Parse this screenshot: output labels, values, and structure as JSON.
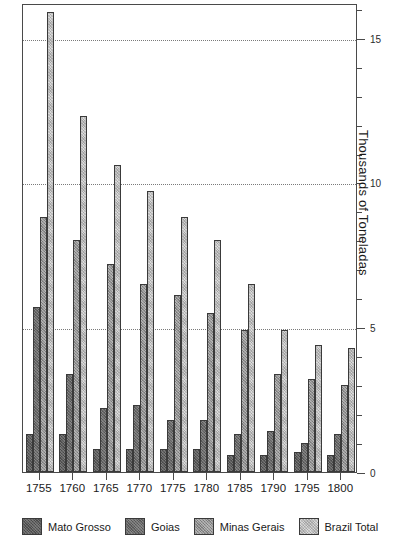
{
  "chart_data": {
    "type": "bar",
    "title": "",
    "subtitle": "",
    "xlabel": "",
    "ylabel": "Thousands of Toneladas",
    "categories": [
      "1755",
      "1760",
      "1765",
      "1770",
      "1775",
      "1780",
      "1785",
      "1790",
      "1795",
      "1800"
    ],
    "series": [
      {
        "name": "Mato Grosso",
        "color": "#595959",
        "values": [
          1.3,
          1.3,
          0.8,
          0.8,
          0.8,
          0.8,
          0.6,
          0.6,
          0.7,
          0.6
        ]
      },
      {
        "name": "Goias",
        "color": "#666666",
        "values": [
          5.7,
          3.4,
          2.2,
          2.3,
          1.8,
          1.8,
          1.3,
          1.4,
          1.0,
          1.3
        ]
      },
      {
        "name": "Minas Gerais",
        "color": "#8f8f8f",
        "values": [
          8.8,
          8.0,
          7.2,
          6.5,
          6.1,
          5.5,
          4.9,
          3.4,
          3.2,
          3.0
        ]
      },
      {
        "name": "Brazil Total",
        "color": "#d9d9d9",
        "values": [
          15.9,
          12.3,
          10.6,
          9.7,
          8.8,
          8.0,
          6.5,
          4.9,
          4.4,
          4.3
        ]
      }
    ],
    "ylim": [
      0,
      16.2
    ],
    "yticks": [
      0,
      5,
      10,
      15
    ],
    "yticklabels": [
      "0",
      "5",
      "10",
      "15"
    ],
    "yminorticks": [
      1,
      2,
      3,
      4,
      6,
      7,
      8,
      9,
      11,
      12,
      13,
      14,
      16
    ],
    "gridlines": [
      5,
      10,
      15
    ],
    "grid": "horizontal-dotted",
    "axis_position": "right",
    "legend_position": "bottom"
  },
  "legend": {
    "items": [
      {
        "label": "Mato Grosso"
      },
      {
        "label": "Goias"
      },
      {
        "label": "Minas Gerais"
      },
      {
        "label": "Brazil Total"
      }
    ]
  },
  "caption": ""
}
